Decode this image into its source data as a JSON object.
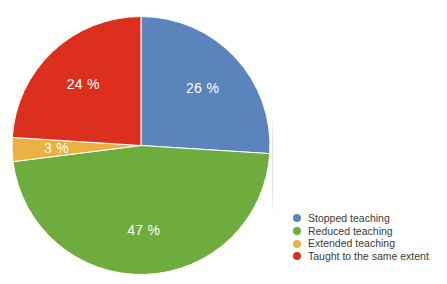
{
  "page": {
    "background": "#ffffff"
  },
  "chart_data": {
    "type": "pie",
    "title": "",
    "start_angle_deg": 0,
    "direction": "clockwise",
    "unit": "%",
    "slices": [
      {
        "label": "Stopped teaching",
        "value": 26,
        "display": "26 %",
        "color": "#5b84bd"
      },
      {
        "label": "Reduced teaching",
        "value": 47,
        "display": "47 %",
        "color": "#6dac3d"
      },
      {
        "label": "Extended teaching",
        "value": 3,
        "display": "3 %",
        "color": "#eab143"
      },
      {
        "label": "Taught to the same extent",
        "value": 24,
        "display": "24 %",
        "color": "#dd2f1d"
      }
    ],
    "slice_label_color": "#ffffff",
    "separator_color": "#ffffff",
    "legend": {
      "position": "right-bottom",
      "marker_shape": "circle",
      "text_color": "#3b3b3b"
    }
  }
}
